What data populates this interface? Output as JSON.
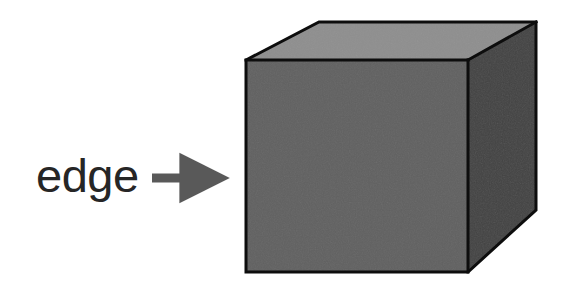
{
  "canvas": {
    "width": 565,
    "height": 285,
    "background_color": "#ffffff"
  },
  "diagram": {
    "title": "edge",
    "annotation": {
      "label": "edge",
      "label_color": "#262626",
      "pointer_icon": "right-arrow-icon",
      "pointer_color": "#595959",
      "points_to": "front-left-vertical-edge"
    },
    "shape": {
      "name": "cube",
      "outline_color": "#0d0d0d",
      "outline_width": 3,
      "faces": [
        {
          "name": "front-face",
          "color": "#595959",
          "points": "246,60 468,60 468,272 246,272"
        },
        {
          "name": "top-face",
          "color": "#828282",
          "points": "246,60 319,22 536,22 468,60"
        },
        {
          "name": "right-face",
          "color": "#3a3a3a",
          "points": "468,60 536,22 536,210 468,272"
        }
      ],
      "edges": [
        {
          "name": "front-top-edge",
          "from": "246,60",
          "to": "468,60"
        },
        {
          "name": "front-left-edge",
          "from": "246,60",
          "to": "246,272"
        },
        {
          "name": "front-bottom-edge",
          "from": "246,272",
          "to": "468,272"
        },
        {
          "name": "front-right-edge",
          "from": "468,60",
          "to": "468,272"
        },
        {
          "name": "top-left-edge",
          "from": "246,60",
          "to": "319,22"
        },
        {
          "name": "top-back-edge",
          "from": "319,22",
          "to": "536,22"
        },
        {
          "name": "top-right-edge",
          "from": "468,60",
          "to": "536,22"
        },
        {
          "name": "right-back-edge",
          "from": "536,22",
          "to": "536,210"
        },
        {
          "name": "right-bottom-edge",
          "from": "536,210",
          "to": "468,272"
        }
      ]
    }
  }
}
